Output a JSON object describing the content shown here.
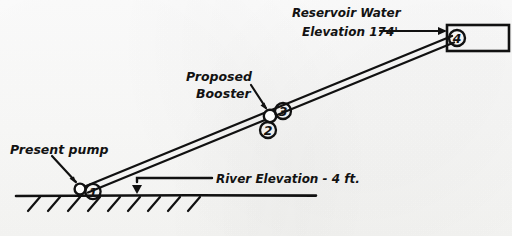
{
  "diagram": {
    "ink_color": "#111111",
    "paper_color": "#fdfdfc",
    "labels": {
      "present_pump": "Present pump",
      "proposed_booster_line1": "Proposed",
      "proposed_booster_line2": "Booster",
      "reservoir_line1": "Reservoir Water",
      "reservoir_line2": "Elevation 174'",
      "river_elevation": "River Elevation - 4 ft."
    },
    "nodes": [
      {
        "id": "1",
        "label": "1",
        "name": "present-pump-station"
      },
      {
        "id": "2",
        "label": "2",
        "name": "booster-suction"
      },
      {
        "id": "3",
        "label": "3",
        "name": "booster-discharge"
      },
      {
        "id": "4",
        "label": "4",
        "name": "reservoir-inlet"
      }
    ],
    "elevations": {
      "river_value": "4",
      "river_units": "ft.",
      "reservoir_value": "174",
      "reservoir_units": "'"
    }
  }
}
